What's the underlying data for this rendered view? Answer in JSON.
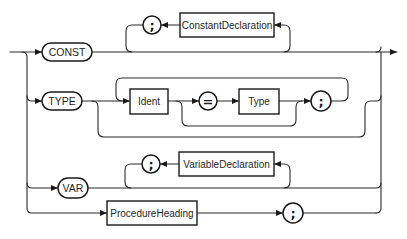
{
  "diagram": {
    "type": "syntax-diagram",
    "title": "",
    "branches": [
      {
        "id": "const",
        "keyword": "CONST",
        "repeat_separator": ";",
        "item": "ConstantDeclaration"
      },
      {
        "id": "type",
        "keyword": "TYPE",
        "sequence": [
          "Ident",
          "=",
          "Type",
          ";"
        ],
        "optional_part": [
          "=",
          "Type"
        ]
      },
      {
        "id": "var",
        "keyword": "VAR",
        "repeat_separator": ";",
        "item": "VariableDeclaration"
      },
      {
        "id": "procedure",
        "sequence": [
          "ProcedureHeading",
          ";"
        ]
      }
    ]
  },
  "labels": {
    "const_kw": "CONST",
    "const_sep": ";",
    "const_item": "ConstantDeclaration",
    "type_kw": "TYPE",
    "type_ident": "Ident",
    "type_eq": "=",
    "type_type": "Type",
    "type_semi": ";",
    "var_kw": "VAR",
    "var_sep": ";",
    "var_item": "VariableDeclaration",
    "proc_heading": "ProcedureHeading",
    "proc_semi": ";"
  },
  "colors": {
    "stroke": "#1a1a1a",
    "background": "#ffffff"
  }
}
